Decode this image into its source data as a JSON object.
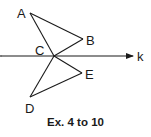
{
  "figure": {
    "caption": "Ex. 4 to 10",
    "line": {
      "name": "k",
      "label": "k"
    },
    "points": {
      "A": {
        "label": "A"
      },
      "B": {
        "label": "B"
      },
      "C": {
        "label": "C"
      },
      "D": {
        "label": "D"
      },
      "E": {
        "label": "E"
      }
    },
    "colors": {
      "stroke": "#1a1a1a",
      "background": "#ffffff"
    }
  }
}
